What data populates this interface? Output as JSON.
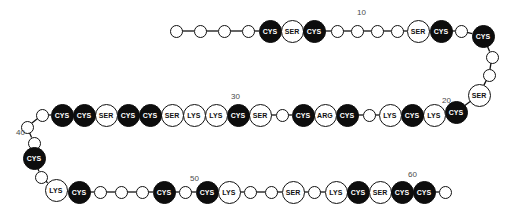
{
  "diagram": {
    "kind": "protein-sequence-chain",
    "background_color": "#ffffff",
    "line_color": "#111111",
    "dark_residue_color": "#0d0d0d",
    "light_residue_color": "#ffffff",
    "label_color": "#4a4a4a",
    "position_labels": [
      {
        "text": "10",
        "x": 357,
        "y": 8
      },
      {
        "text": "20",
        "x": 442,
        "y": 96
      },
      {
        "text": "30",
        "x": 231,
        "y": 92
      },
      {
        "text": "40",
        "x": 16,
        "y": 128
      },
      {
        "text": "50",
        "x": 190,
        "y": 174
      },
      {
        "text": "60",
        "x": 408,
        "y": 170
      }
    ],
    "residues": [
      {
        "i": 1,
        "label": "",
        "style": "plain",
        "x": 176,
        "y": 31,
        "r": 6.5
      },
      {
        "i": 2,
        "label": "",
        "style": "plain",
        "x": 200,
        "y": 31,
        "r": 6.5
      },
      {
        "i": 3,
        "label": "",
        "style": "plain",
        "x": 224,
        "y": 31,
        "r": 6.5
      },
      {
        "i": 4,
        "label": "",
        "style": "plain",
        "x": 248,
        "y": 31,
        "r": 6.5
      },
      {
        "i": 5,
        "label": "CYS",
        "style": "dark",
        "x": 270,
        "y": 31,
        "r": 11.5
      },
      {
        "i": 6,
        "label": "SER",
        "style": "light",
        "x": 292,
        "y": 31,
        "r": 11.5
      },
      {
        "i": 7,
        "label": "CYS",
        "style": "dark",
        "x": 314,
        "y": 31,
        "r": 11.5
      },
      {
        "i": 8,
        "label": "",
        "style": "plain",
        "x": 337,
        "y": 31,
        "r": 6.5
      },
      {
        "i": 9,
        "label": "",
        "style": "plain",
        "x": 357,
        "y": 31,
        "r": 6.5
      },
      {
        "i": 10,
        "label": "",
        "style": "plain",
        "x": 377,
        "y": 31,
        "r": 6.5
      },
      {
        "i": 11,
        "label": "",
        "style": "plain",
        "x": 397,
        "y": 31,
        "r": 6.5
      },
      {
        "i": 12,
        "label": "SER",
        "style": "light",
        "x": 418,
        "y": 31,
        "r": 11.5
      },
      {
        "i": 13,
        "label": "CYS",
        "style": "dark",
        "x": 441,
        "y": 31,
        "r": 11.5
      },
      {
        "i": 14,
        "label": "",
        "style": "plain",
        "x": 461,
        "y": 31,
        "r": 6.5
      },
      {
        "i": 15,
        "label": "CYS",
        "style": "dark",
        "x": 483,
        "y": 36,
        "r": 11.5
      },
      {
        "i": 16,
        "label": "",
        "style": "plain",
        "x": 492,
        "y": 57,
        "r": 6.5
      },
      {
        "i": 17,
        "label": "",
        "style": "plain",
        "x": 489,
        "y": 75,
        "r": 6.5
      },
      {
        "i": 18,
        "label": "SER",
        "style": "light",
        "x": 479,
        "y": 95,
        "r": 11.5
      },
      {
        "i": 19,
        "label": "CYS",
        "style": "dark",
        "x": 456,
        "y": 112,
        "r": 11.5
      },
      {
        "i": 20,
        "label": "LYS",
        "style": "light",
        "x": 434,
        "y": 115,
        "r": 11.5
      },
      {
        "i": 21,
        "label": "CYS",
        "style": "dark",
        "x": 412,
        "y": 115,
        "r": 11.5
      },
      {
        "i": 22,
        "label": "LYS",
        "style": "light",
        "x": 390,
        "y": 115,
        "r": 11.5
      },
      {
        "i": 23,
        "label": "",
        "style": "plain",
        "x": 369,
        "y": 115,
        "r": 6.5
      },
      {
        "i": 24,
        "label": "CYS",
        "style": "dark",
        "x": 347,
        "y": 115,
        "r": 11.5
      },
      {
        "i": 25,
        "label": "ARG",
        "style": "light",
        "x": 325,
        "y": 115,
        "r": 11.5
      },
      {
        "i": 26,
        "label": "CYS",
        "style": "dark",
        "x": 303,
        "y": 115,
        "r": 11.5
      },
      {
        "i": 27,
        "label": "",
        "style": "plain",
        "x": 282,
        "y": 115,
        "r": 6.5
      },
      {
        "i": 28,
        "label": "SER",
        "style": "light",
        "x": 260,
        "y": 115,
        "r": 11.5
      },
      {
        "i": 29,
        "label": "CYS",
        "style": "dark",
        "x": 238,
        "y": 115,
        "r": 11.5
      },
      {
        "i": 30,
        "label": "LYS",
        "style": "light",
        "x": 216,
        "y": 115,
        "r": 11.5
      },
      {
        "i": 31,
        "label": "LYS",
        "style": "light",
        "x": 194,
        "y": 115,
        "r": 11.5
      },
      {
        "i": 32,
        "label": "SER",
        "style": "light",
        "x": 172,
        "y": 115,
        "r": 11.5
      },
      {
        "i": 33,
        "label": "CYS",
        "style": "dark",
        "x": 150,
        "y": 115,
        "r": 11.5
      },
      {
        "i": 34,
        "label": "CYS",
        "style": "dark",
        "x": 128,
        "y": 115,
        "r": 11.5
      },
      {
        "i": 35,
        "label": "SER",
        "style": "light",
        "x": 106,
        "y": 115,
        "r": 11.5
      },
      {
        "i": 36,
        "label": "CYS",
        "style": "dark",
        "x": 84,
        "y": 115,
        "r": 11.5
      },
      {
        "i": 37,
        "label": "CYS",
        "style": "dark",
        "x": 62,
        "y": 115,
        "r": 11.5
      },
      {
        "i": 38,
        "label": "",
        "style": "plain",
        "x": 42,
        "y": 115,
        "r": 6.5
      },
      {
        "i": 39,
        "label": "",
        "style": "plain",
        "x": 27,
        "y": 127,
        "r": 6.5
      },
      {
        "i": 40,
        "label": "",
        "style": "plain",
        "x": 34,
        "y": 143,
        "r": 6.5
      },
      {
        "i": 41,
        "label": "CYS",
        "style": "dark",
        "x": 34,
        "y": 158,
        "r": 11.5
      },
      {
        "i": 42,
        "label": "",
        "style": "plain",
        "x": 41,
        "y": 177,
        "r": 6.5
      },
      {
        "i": 43,
        "label": "LYS",
        "style": "light",
        "x": 56,
        "y": 190,
        "r": 11.5
      },
      {
        "i": 44,
        "label": "CYS",
        "style": "dark",
        "x": 79,
        "y": 192,
        "r": 11.5
      },
      {
        "i": 45,
        "label": "",
        "style": "plain",
        "x": 100,
        "y": 192,
        "r": 6.5
      },
      {
        "i": 46,
        "label": "",
        "style": "plain",
        "x": 121,
        "y": 192,
        "r": 6.5
      },
      {
        "i": 47,
        "label": "",
        "style": "plain",
        "x": 142,
        "y": 192,
        "r": 6.5
      },
      {
        "i": 48,
        "label": "CYS",
        "style": "dark",
        "x": 164,
        "y": 192,
        "r": 11.5
      },
      {
        "i": 49,
        "label": "",
        "style": "plain",
        "x": 185,
        "y": 192,
        "r": 6.5
      },
      {
        "i": 50,
        "label": "CYS",
        "style": "dark",
        "x": 207,
        "y": 192,
        "r": 11.5
      },
      {
        "i": 51,
        "label": "LYS",
        "style": "light",
        "x": 229,
        "y": 192,
        "r": 11.5
      },
      {
        "i": 52,
        "label": "",
        "style": "plain",
        "x": 250,
        "y": 192,
        "r": 6.5
      },
      {
        "i": 53,
        "label": "",
        "style": "plain",
        "x": 271,
        "y": 192,
        "r": 6.5
      },
      {
        "i": 54,
        "label": "SER",
        "style": "light",
        "x": 293,
        "y": 192,
        "r": 11.5
      },
      {
        "i": 55,
        "label": "",
        "style": "plain",
        "x": 314,
        "y": 192,
        "r": 6.5
      },
      {
        "i": 56,
        "label": "LYS",
        "style": "light",
        "x": 336,
        "y": 192,
        "r": 11.5
      },
      {
        "i": 57,
        "label": "CYS",
        "style": "dark",
        "x": 358,
        "y": 192,
        "r": 11.5
      },
      {
        "i": 58,
        "label": "SER",
        "style": "light",
        "x": 380,
        "y": 192,
        "r": 11.5
      },
      {
        "i": 59,
        "label": "CYS",
        "style": "dark",
        "x": 402,
        "y": 192,
        "r": 11.5
      },
      {
        "i": 60,
        "label": "CYS",
        "style": "dark",
        "x": 424,
        "y": 192,
        "r": 11.5
      },
      {
        "i": 61,
        "label": "",
        "style": "plain",
        "x": 445,
        "y": 192,
        "r": 6.5
      }
    ]
  }
}
